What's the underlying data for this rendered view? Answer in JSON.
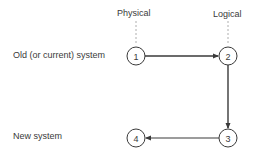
{
  "columns": {
    "physical": {
      "label": "Physical"
    },
    "logical": {
      "label": "Logical"
    }
  },
  "rows": {
    "old": {
      "label": "Old (or current) system"
    },
    "new": {
      "label": "New system"
    }
  },
  "nodes": [
    {
      "id": "1",
      "label": "1",
      "row": "old",
      "column": "physical"
    },
    {
      "id": "2",
      "label": "2",
      "row": "old",
      "column": "logical"
    },
    {
      "id": "3",
      "label": "3",
      "row": "new",
      "column": "logical"
    },
    {
      "id": "4",
      "label": "4",
      "row": "new",
      "column": "physical"
    }
  ],
  "edges": [
    {
      "from": "1",
      "to": "2"
    },
    {
      "from": "2",
      "to": "3"
    },
    {
      "from": "3",
      "to": "4"
    }
  ],
  "colors": {
    "ink": "#3a3a3a",
    "dash": "#9a9a9a",
    "background": "#ffffff"
  }
}
